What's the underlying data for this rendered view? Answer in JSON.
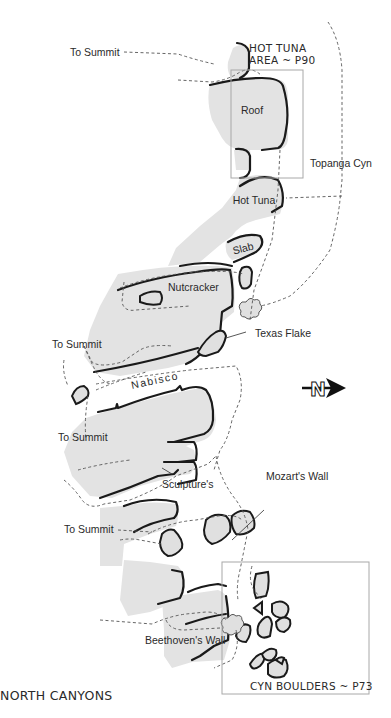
{
  "map": {
    "title": "NORTH CANYONS",
    "areas": [
      {
        "label_line1": "HOT TUNA",
        "label_line2": "AREA ~ P90"
      },
      {
        "label": "CYN BOULDERS ~ P73"
      }
    ],
    "walls": [
      {
        "label": "Roof"
      },
      {
        "label": "Hot Tuna"
      },
      {
        "label": "Slab"
      },
      {
        "label": "Nutcracker"
      },
      {
        "label": "Texas Flake"
      },
      {
        "label": "Nabisco"
      },
      {
        "label": "Sculpture's"
      },
      {
        "label": "Mozart's Wall"
      },
      {
        "label": "Beethoven's Wall"
      }
    ],
    "trails": [
      {
        "label": "To Summit"
      },
      {
        "label": "To Summit"
      },
      {
        "label": "To Summit"
      },
      {
        "label": "To Summit"
      },
      {
        "label": "Topanga Cyn"
      }
    ],
    "compass": {
      "letter": "N",
      "icon": "north-arrow-icon"
    },
    "colors": {
      "rock_fill": "#e3e3e3",
      "outline": "#1a1a1a",
      "frame": "#a8a8a8"
    }
  }
}
